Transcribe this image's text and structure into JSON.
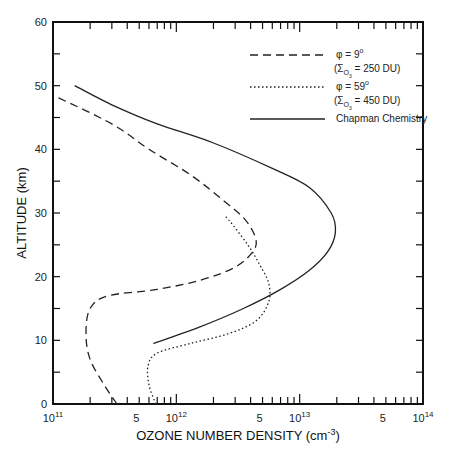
{
  "chart_data": {
    "type": "line",
    "title": "",
    "xlabel": "OZONE NUMBER DENSITY (cm⁻³)",
    "ylabel": "ALTITUDE (km)",
    "xscale": "log",
    "xlim": [
      100000000000.0,
      100000000000000.0
    ],
    "ylim": [
      0,
      60
    ],
    "grid": false,
    "legend_position": "upper right (inside)",
    "y_ticks": [
      0,
      10,
      20,
      30,
      40,
      50,
      60
    ],
    "x_tick_labels": [
      {
        "value": 100000000000.0,
        "label": "10",
        "exp": "11"
      },
      {
        "value": 500000000000.0,
        "label": "5",
        "exp": ""
      },
      {
        "value": 1000000000000.0,
        "label": "10",
        "exp": "12"
      },
      {
        "value": 5000000000000.0,
        "label": "5",
        "exp": ""
      },
      {
        "value": 10000000000000.0,
        "label": "10",
        "exp": "13"
      },
      {
        "value": 50000000000000.0,
        "label": "5",
        "exp": ""
      },
      {
        "value": 100000000000000.0,
        "label": "10",
        "exp": "14"
      }
    ],
    "series": [
      {
        "name": "φ = 9° (ΣO3 = 250 DU)",
        "style": "dashed",
        "points": [
          {
            "x": 330000000000.0,
            "y": 0
          },
          {
            "x": 260000000000.0,
            "y": 3
          },
          {
            "x": 200000000000.0,
            "y": 7
          },
          {
            "x": 185000000000.0,
            "y": 11
          },
          {
            "x": 200000000000.0,
            "y": 15
          },
          {
            "x": 280000000000.0,
            "y": 17
          },
          {
            "x": 700000000000.0,
            "y": 18
          },
          {
            "x": 1600000000000.0,
            "y": 19.5
          },
          {
            "x": 3000000000000.0,
            "y": 21.5
          },
          {
            "x": 4200000000000.0,
            "y": 24
          },
          {
            "x": 4400000000000.0,
            "y": 26
          },
          {
            "x": 3600000000000.0,
            "y": 29
          },
          {
            "x": 2400000000000.0,
            "y": 32
          },
          {
            "x": 1300000000000.0,
            "y": 36
          },
          {
            "x": 600000000000.0,
            "y": 40
          },
          {
            "x": 300000000000.0,
            "y": 44
          },
          {
            "x": 100000000000.0,
            "y": 48.5
          }
        ]
      },
      {
        "name": "φ = 59° (ΣO3 = 450 DU)",
        "style": "dotted",
        "points": [
          {
            "x": 680000000000.0,
            "y": 0
          },
          {
            "x": 600000000000.0,
            "y": 3
          },
          {
            "x": 590000000000.0,
            "y": 6
          },
          {
            "x": 700000000000.0,
            "y": 8
          },
          {
            "x": 1300000000000.0,
            "y": 9.5
          },
          {
            "x": 2600000000000.0,
            "y": 11
          },
          {
            "x": 4400000000000.0,
            "y": 13
          },
          {
            "x": 5600000000000.0,
            "y": 16
          },
          {
            "x": 5600000000000.0,
            "y": 19
          },
          {
            "x": 4700000000000.0,
            "y": 22
          },
          {
            "x": 3800000000000.0,
            "y": 25
          },
          {
            "x": 2900000000000.0,
            "y": 28
          },
          {
            "x": 2500000000000.0,
            "y": 29.5
          }
        ]
      },
      {
        "name": "Chapman Chemistry",
        "style": "solid",
        "points": [
          {
            "x": 650000000000.0,
            "y": 9.5
          },
          {
            "x": 1500000000000.0,
            "y": 12
          },
          {
            "x": 3500000000000.0,
            "y": 15
          },
          {
            "x": 7000000000000.0,
            "y": 18
          },
          {
            "x": 12000000000000.0,
            "y": 21
          },
          {
            "x": 17000000000000.0,
            "y": 24
          },
          {
            "x": 19500000000000.0,
            "y": 27
          },
          {
            "x": 18000000000000.0,
            "y": 30
          },
          {
            "x": 12000000000000.0,
            "y": 34
          },
          {
            "x": 6000000000000.0,
            "y": 37
          },
          {
            "x": 2000000000000.0,
            "y": 41
          },
          {
            "x": 700000000000.0,
            "y": 44
          },
          {
            "x": 300000000000.0,
            "y": 47
          },
          {
            "x": 150000000000.0,
            "y": 50
          }
        ]
      }
    ]
  },
  "axes": {
    "y_title": "ALTITUDE (km)",
    "x_title_main": "OZONE NUMBER DENSITY (cm",
    "x_title_exp": "-3",
    "x_title_close": ")",
    "y_labels": [
      "0",
      "10",
      "20",
      "30",
      "40",
      "50",
      "60"
    ]
  },
  "legend": {
    "items": [
      {
        "line1": "φ = 9",
        "deg": "o",
        "line2_pre": "(Σ",
        "line2_sub": "O",
        "line2_subsub": "3",
        "line2_post": " = 250 DU)"
      },
      {
        "line1": "φ = 59",
        "deg": "o",
        "line2_pre": "(Σ",
        "line2_sub": "O",
        "line2_subsub": "3",
        "line2_post": " = 450 DU)"
      },
      {
        "line1": "Chapman Chemistry"
      }
    ]
  }
}
